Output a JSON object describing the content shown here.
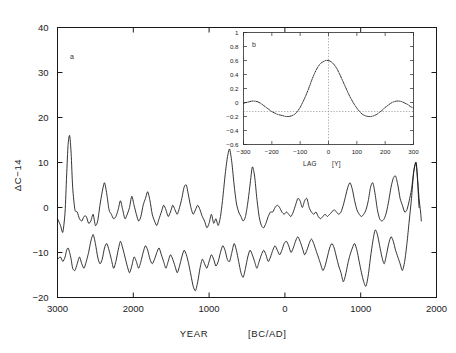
{
  "figure": {
    "background": "#ffffff",
    "line_color": "#111111",
    "axis_color": "#1a1a1a"
  },
  "main": {
    "panel_label": "a",
    "xlabel_text": "YEAR",
    "xlabel_unit": "[BC/AD]",
    "ylabel": "ΔC−14",
    "xticks": [
      "3000",
      "2000",
      "1000",
      "0",
      "1000",
      "2000"
    ],
    "yticks": [
      "40",
      "30",
      "20",
      "10",
      "0",
      "−10",
      "−20"
    ]
  },
  "inset": {
    "panel_label": "b",
    "xlabel_text": "LAG",
    "xlabel_unit": "[Y]",
    "xticks": [
      "−300",
      "−200",
      "−100",
      "0",
      "100",
      "200",
      "300"
    ],
    "yticks": [
      "1",
      "0.8",
      "0.6",
      "0.4",
      "0.2",
      "0",
      "−0.2",
      "−0.4",
      "−0.6"
    ]
  },
  "chart_data": [
    {
      "type": "line",
      "id": "panel-a-delta-c14",
      "title": "",
      "panel": "a",
      "xlabel": "YEAR [BC/AD]",
      "ylabel": "ΔC-14",
      "xlim": [
        -3000,
        2000
      ],
      "ylim": [
        -20,
        40
      ],
      "xtick_values": [
        -3000,
        -2000,
        -1000,
        0,
        1000,
        2000
      ],
      "xtick_labels": [
        "3000",
        "2000",
        "1000",
        "0",
        "1000",
        "2000"
      ],
      "ytick_values": [
        40,
        30,
        20,
        10,
        0,
        -10,
        -20
      ],
      "grid": false,
      "legend": null,
      "note": "Two offset ΔC-14 records; x runs 3000 BC (left) to ~1800 AD (right); curves merge at right end.",
      "series": [
        {
          "name": "upper-record",
          "x": [
            -3000,
            -2960,
            -2930,
            -2900,
            -2880,
            -2860,
            -2840,
            -2820,
            -2800,
            -2770,
            -2740,
            -2710,
            -2680,
            -2650,
            -2620,
            -2590,
            -2560,
            -2530,
            -2500,
            -2470,
            -2440,
            -2410,
            -2380,
            -2350,
            -2320,
            -2290,
            -2260,
            -2230,
            -2200,
            -2170,
            -2140,
            -2110,
            -2080,
            -2050,
            -2020,
            -1990,
            -1960,
            -1930,
            -1900,
            -1870,
            -1840,
            -1810,
            -1780,
            -1750,
            -1720,
            -1690,
            -1660,
            -1630,
            -1600,
            -1570,
            -1540,
            -1510,
            -1480,
            -1450,
            -1420,
            -1390,
            -1360,
            -1330,
            -1300,
            -1270,
            -1240,
            -1210,
            -1180,
            -1150,
            -1120,
            -1090,
            -1060,
            -1030,
            -1000,
            -970,
            -940,
            -910,
            -880,
            -850,
            -820,
            -790,
            -760,
            -730,
            -700,
            -670,
            -640,
            -610,
            -580,
            -550,
            -520,
            -490,
            -460,
            -430,
            -400,
            -370,
            -340,
            -310,
            -280,
            -250,
            -220,
            -190,
            -160,
            -130,
            -100,
            -70,
            -40,
            -10,
            20,
            50,
            80,
            110,
            140,
            170,
            200,
            230,
            260,
            290,
            320,
            350,
            380,
            410,
            440,
            470,
            500,
            530,
            560,
            590,
            620,
            650,
            680,
            710,
            740,
            770,
            800,
            830,
            860,
            890,
            920,
            950,
            980,
            1010,
            1040,
            1070,
            1100,
            1130,
            1160,
            1190,
            1220,
            1250,
            1280,
            1310,
            1340,
            1370,
            1400,
            1430,
            1460,
            1490,
            1520,
            1550,
            1580,
            1610,
            1640,
            1670,
            1700,
            1730,
            1750,
            1770,
            1790,
            1800
          ],
          "y": [
            -2.5,
            -4.0,
            -5.5,
            -1.0,
            7.0,
            14.0,
            16.0,
            12.0,
            4.5,
            -0.5,
            -1.0,
            -2.5,
            -3.0,
            -2.0,
            -2.0,
            -3.5,
            -3.0,
            -1.5,
            -4.0,
            -3.0,
            0.5,
            3.5,
            5.5,
            3.0,
            -0.5,
            -1.5,
            -2.5,
            -2.0,
            -0.5,
            1.5,
            -0.5,
            -2.5,
            -1.5,
            0.0,
            2.5,
            0.5,
            -1.5,
            -3.0,
            -2.0,
            0.5,
            2.0,
            3.5,
            1.5,
            -1.5,
            -3.0,
            -4.0,
            -2.5,
            -1.0,
            0.5,
            -0.5,
            -2.0,
            -1.0,
            0.5,
            -0.5,
            -1.5,
            0.0,
            2.0,
            4.5,
            5.0,
            2.5,
            0.0,
            -1.5,
            -0.5,
            0.5,
            -0.5,
            -2.0,
            -3.0,
            -4.5,
            -3.5,
            -1.5,
            -3.5,
            -2.5,
            -4.0,
            -2.0,
            2.0,
            7.0,
            11.0,
            13.0,
            10.0,
            5.0,
            1.0,
            -1.0,
            -2.0,
            -3.0,
            -2.0,
            1.0,
            5.0,
            9.0,
            7.0,
            2.0,
            -2.0,
            -4.0,
            -4.5,
            -3.5,
            -2.0,
            -1.0,
            -1.0,
            0.0,
            0.5,
            0.0,
            -1.0,
            -1.5,
            -1.0,
            -1.5,
            -2.0,
            -1.0,
            0.5,
            2.0,
            1.5,
            0.0,
            1.5,
            2.0,
            0.0,
            -1.0,
            -1.5,
            -1.0,
            -2.0,
            -2.5,
            -2.0,
            -1.5,
            -2.0,
            -1.5,
            -1.0,
            -0.5,
            -1.0,
            -1.5,
            -1.0,
            0.5,
            2.5,
            4.5,
            5.5,
            4.0,
            1.5,
            -0.5,
            -1.5,
            -2.0,
            -1.5,
            -0.5,
            1.5,
            4.5,
            5.5,
            3.0,
            -0.5,
            -2.5,
            -3.0,
            -2.5,
            -1.0,
            1.5,
            4.5,
            6.5,
            7.0,
            5.0,
            2.0,
            0.5,
            -1.0,
            -0.5,
            1.5,
            4.0,
            8.0,
            10.0,
            6.5,
            2.0,
            -1.0,
            -3.0
          ]
        },
        {
          "name": "lower-record",
          "x": [
            -3000,
            -2960,
            -2930,
            -2900,
            -2880,
            -2860,
            -2840,
            -2820,
            -2800,
            -2770,
            -2740,
            -2710,
            -2680,
            -2650,
            -2620,
            -2590,
            -2560,
            -2530,
            -2500,
            -2470,
            -2440,
            -2410,
            -2380,
            -2350,
            -2320,
            -2290,
            -2260,
            -2230,
            -2200,
            -2170,
            -2140,
            -2110,
            -2080,
            -2050,
            -2020,
            -1990,
            -1960,
            -1930,
            -1900,
            -1870,
            -1840,
            -1810,
            -1780,
            -1750,
            -1720,
            -1690,
            -1660,
            -1630,
            -1600,
            -1570,
            -1540,
            -1510,
            -1480,
            -1450,
            -1420,
            -1390,
            -1360,
            -1330,
            -1300,
            -1270,
            -1240,
            -1210,
            -1180,
            -1150,
            -1120,
            -1090,
            -1060,
            -1030,
            -1000,
            -970,
            -940,
            -910,
            -880,
            -850,
            -820,
            -790,
            -760,
            -730,
            -700,
            -670,
            -640,
            -610,
            -580,
            -550,
            -520,
            -490,
            -460,
            -430,
            -400,
            -370,
            -340,
            -310,
            -280,
            -250,
            -220,
            -190,
            -160,
            -130,
            -100,
            -70,
            -40,
            -10,
            20,
            50,
            80,
            110,
            140,
            170,
            200,
            230,
            260,
            290,
            320,
            350,
            380,
            410,
            440,
            470,
            500,
            530,
            560,
            590,
            620,
            650,
            680,
            710,
            740,
            770,
            800,
            830,
            860,
            890,
            920,
            950,
            980,
            1010,
            1040,
            1070,
            1100,
            1130,
            1160,
            1190,
            1220,
            1250,
            1280,
            1310,
            1340,
            1370,
            1400,
            1430,
            1460,
            1490,
            1520,
            1550,
            1580,
            1610,
            1640,
            1670,
            1700,
            1730,
            1750,
            1770,
            1790,
            1800
          ],
          "y": [
            -11.5,
            -11.0,
            -12.0,
            -11.0,
            -9.5,
            -9.0,
            -10.0,
            -11.5,
            -13.5,
            -14.0,
            -12.5,
            -11.0,
            -12.5,
            -13.5,
            -12.0,
            -10.0,
            -7.5,
            -6.0,
            -8.0,
            -11.0,
            -12.5,
            -11.5,
            -9.0,
            -8.0,
            -9.5,
            -11.5,
            -13.5,
            -12.0,
            -9.5,
            -7.5,
            -9.0,
            -11.0,
            -13.0,
            -14.5,
            -13.0,
            -11.0,
            -12.0,
            -13.5,
            -12.0,
            -10.0,
            -8.5,
            -9.5,
            -11.5,
            -12.5,
            -11.5,
            -10.0,
            -9.0,
            -10.5,
            -12.0,
            -13.5,
            -12.0,
            -10.5,
            -11.5,
            -13.0,
            -14.5,
            -13.0,
            -11.0,
            -9.5,
            -10.5,
            -12.5,
            -15.0,
            -17.5,
            -18.5,
            -16.5,
            -13.5,
            -11.5,
            -12.5,
            -13.5,
            -12.0,
            -10.5,
            -11.5,
            -13.0,
            -12.0,
            -10.0,
            -8.5,
            -9.5,
            -11.5,
            -12.0,
            -10.0,
            -8.0,
            -9.5,
            -12.0,
            -14.5,
            -15.5,
            -13.5,
            -11.0,
            -9.5,
            -10.5,
            -12.0,
            -13.5,
            -12.0,
            -10.5,
            -9.5,
            -10.5,
            -12.0,
            -11.0,
            -9.5,
            -8.5,
            -9.5,
            -10.5,
            -9.5,
            -8.0,
            -7.5,
            -8.5,
            -10.0,
            -9.0,
            -7.5,
            -6.5,
            -7.5,
            -9.0,
            -10.5,
            -9.5,
            -8.0,
            -7.0,
            -8.0,
            -9.5,
            -11.0,
            -12.5,
            -14.0,
            -13.0,
            -11.0,
            -9.0,
            -8.0,
            -9.0,
            -11.0,
            -13.0,
            -14.5,
            -16.5,
            -15.0,
            -12.5,
            -10.5,
            -9.0,
            -8.0,
            -9.5,
            -12.0,
            -14.5,
            -16.5,
            -17.5,
            -15.0,
            -11.0,
            -7.5,
            -5.0,
            -6.0,
            -8.5,
            -11.0,
            -12.5,
            -10.5,
            -8.0,
            -6.5,
            -7.5,
            -9.5,
            -11.0,
            -12.5,
            -14.0,
            -12.0,
            -8.0,
            -3.0,
            2.0,
            8.0,
            10.0,
            6.0,
            0.0,
            -3.0
          ]
        }
      ]
    },
    {
      "type": "line",
      "id": "panel-b-cross-correlation",
      "title": "",
      "panel": "b",
      "xlabel": "LAG [Y]",
      "ylabel": "",
      "xlim": [
        -300,
        300
      ],
      "ylim": [
        -0.6,
        1.0
      ],
      "xtick_values": [
        -300,
        -200,
        -100,
        0,
        100,
        200,
        300
      ],
      "ytick_values": [
        1,
        0.8,
        0.6,
        0.4,
        0.2,
        0,
        -0.2,
        -0.4,
        -0.6
      ],
      "grid": false,
      "legend": null,
      "note": "Dotted cross-correlation curve; zero-lag vertical dotted guide and zero-level horizontal dotted guide.",
      "series": [
        {
          "name": "cross-correlation",
          "x": [
            -300,
            -290,
            -280,
            -270,
            -260,
            -250,
            -240,
            -230,
            -220,
            -210,
            -200,
            -190,
            -180,
            -170,
            -160,
            -150,
            -140,
            -130,
            -120,
            -110,
            -100,
            -90,
            -80,
            -70,
            -60,
            -50,
            -40,
            -30,
            -20,
            -10,
            0,
            10,
            20,
            30,
            40,
            50,
            60,
            70,
            80,
            90,
            100,
            110,
            120,
            130,
            140,
            150,
            160,
            170,
            180,
            190,
            200,
            210,
            220,
            230,
            240,
            250,
            260,
            270,
            280,
            290,
            300
          ],
          "y": [
            -0.01,
            0.0,
            0.01,
            0.02,
            0.02,
            0.01,
            -0.01,
            -0.04,
            -0.07,
            -0.1,
            -0.13,
            -0.15,
            -0.17,
            -0.18,
            -0.19,
            -0.2,
            -0.2,
            -0.19,
            -0.17,
            -0.13,
            -0.07,
            0.01,
            0.1,
            0.2,
            0.31,
            0.41,
            0.49,
            0.55,
            0.58,
            0.6,
            0.6,
            0.58,
            0.54,
            0.48,
            0.4,
            0.31,
            0.22,
            0.13,
            0.05,
            -0.02,
            -0.08,
            -0.13,
            -0.17,
            -0.19,
            -0.2,
            -0.2,
            -0.19,
            -0.17,
            -0.14,
            -0.11,
            -0.07,
            -0.04,
            -0.01,
            0.01,
            0.02,
            0.02,
            0.01,
            -0.01,
            -0.03,
            -0.06,
            -0.08
          ]
        }
      ]
    }
  ]
}
